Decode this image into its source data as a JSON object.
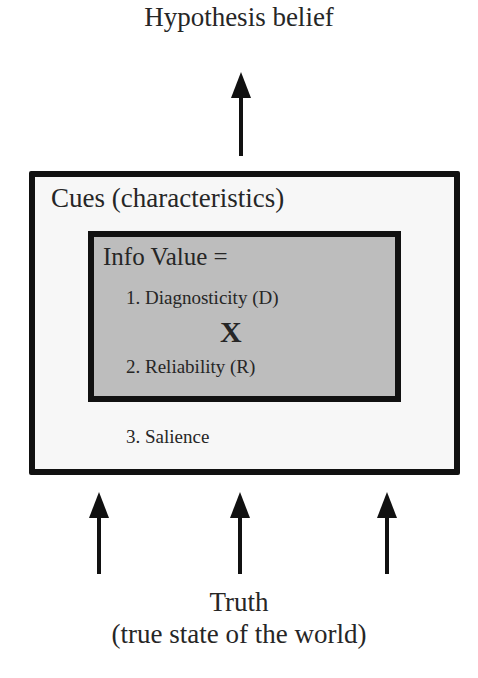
{
  "diagram": {
    "top_label": "Hypothesis belief",
    "outer_box": {
      "label": "Cues (characteristics)",
      "fill": "#f7f7f7",
      "border": "#111111",
      "items": [
        "3. Salience"
      ]
    },
    "inner_box": {
      "label": "Info Value =",
      "fill": "#bdbdbd",
      "border": "#111111",
      "items": [
        "1. Diagnosticity (D)",
        "2. Reliability (R)"
      ],
      "operator": "X"
    },
    "bottom_label": {
      "line1": "Truth",
      "line2": "(true state of the world)"
    },
    "arrows": {
      "up_to_belief": 1,
      "up_from_truth": 3
    }
  }
}
